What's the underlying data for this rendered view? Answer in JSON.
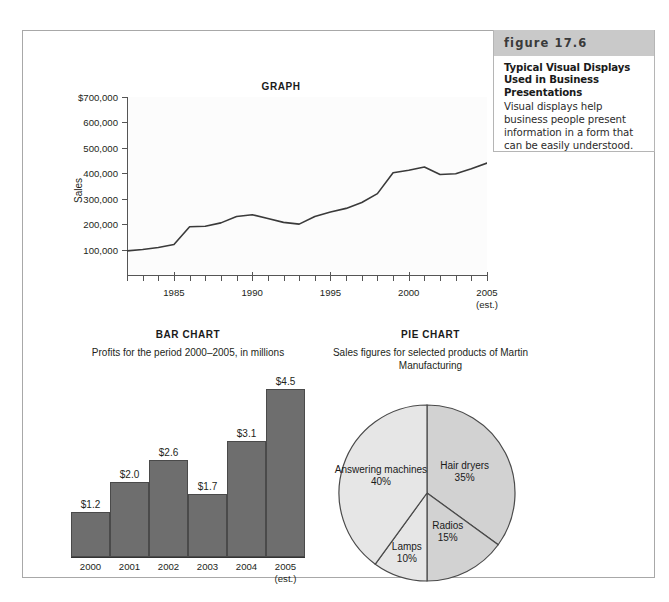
{
  "caption": {
    "figure_label": "figure 17.6",
    "title": "Typical Visual Displays Used in Business Presentations",
    "body": "Visual displays help business people present information in a form that can be easily understood."
  },
  "colors": {
    "bar_fill": "#6e6e6e",
    "bar_stroke": "#4a4a4a",
    "pie_light": "#e6e6e6",
    "pie_mid": "#d2d2d2",
    "pie_stroke": "#4a4a4a",
    "frame_border": "#a8a8a8",
    "caption_head_bg": "#c9c9c9",
    "axis": "#555555",
    "line_stroke": "#3a3a3a"
  },
  "chart_data": [
    {
      "type": "line",
      "title": "GRAPH",
      "xlabel": "",
      "ylabel": "Sales",
      "ylim": [
        0,
        700000
      ],
      "xlim": [
        1982,
        2005
      ],
      "grid": false,
      "legend": "none",
      "ytick_labels": [
        "$700,000",
        "600,000",
        "500,000",
        "400,000",
        "300,000",
        "200,000",
        "100,000"
      ],
      "ytick_values": [
        700000,
        600000,
        500000,
        400000,
        300000,
        200000,
        100000
      ],
      "xtick_labels": [
        "1985",
        "1990",
        "1995",
        "2000",
        "2005"
      ],
      "xtick_values": [
        1985,
        1990,
        1995,
        2000,
        2005
      ],
      "xtick_note": "(est.)",
      "x": [
        1982,
        1983,
        1984,
        1985,
        1986,
        1987,
        1988,
        1989,
        1990,
        1991,
        1992,
        1993,
        1994,
        1995,
        1996,
        1997,
        1998,
        1999,
        2000,
        2001,
        2002,
        2003,
        2004,
        2005
      ],
      "values": [
        95000,
        100000,
        108000,
        120000,
        190000,
        192000,
        205000,
        230000,
        237000,
        222000,
        207000,
        200000,
        230000,
        248000,
        262000,
        285000,
        320000,
        402000,
        412000,
        425000,
        395000,
        398000,
        418000,
        440000
      ]
    },
    {
      "type": "bar",
      "title": "BAR CHART",
      "subtitle": "Profits for the period 2000–2005, in millions",
      "xlabel": "",
      "ylabel": "",
      "ylim": [
        0,
        4.5
      ],
      "grid": false,
      "legend": "none",
      "categories": [
        "2000",
        "2001",
        "2002",
        "2003",
        "2004",
        "2005"
      ],
      "category_notes": [
        "",
        "",
        "",
        "",
        "",
        "(est.)"
      ],
      "values": [
        1.2,
        2.0,
        2.6,
        1.7,
        3.1,
        4.5
      ],
      "value_labels": [
        "$1.2",
        "$2.0",
        "$2.6",
        "$1.7",
        "$3.1",
        "$4.5"
      ]
    },
    {
      "type": "pie",
      "title": "PIE CHART",
      "subtitle": "Sales figures for selected products of Martin Manufacturing",
      "legend": "none",
      "slices": [
        {
          "label": "Hair dryers",
          "value": 35,
          "percent_label": "35%"
        },
        {
          "label": "Radios",
          "value": 15,
          "percent_label": "15%"
        },
        {
          "label": "Lamps",
          "value": 10,
          "percent_label": "10%"
        },
        {
          "label": "Answering machines",
          "value": 40,
          "percent_label": "40%"
        }
      ]
    }
  ]
}
